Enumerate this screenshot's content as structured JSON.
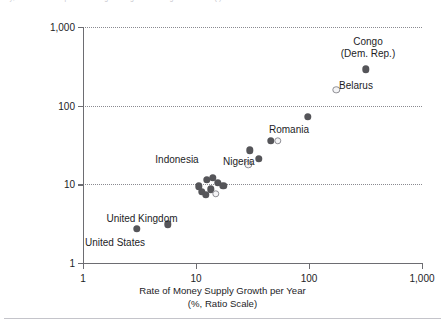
{
  "figure": {
    "top_clipped_caption": "sy, innate and deep into the engineering of the design such as ... ( )",
    "background": "#ffffff",
    "marker_color_solid": "#555559",
    "marker_color_open": "#8e8e94"
  },
  "chart_data": {
    "type": "scatter",
    "title": "",
    "xlabel": "Rate of Money Supply Growth per Year",
    "xlabel_sub": "(%, Ratio Scale)",
    "ylabel": "Rate of Inflation per Year (%, Ratio Scale)",
    "xscale": "log",
    "yscale": "log",
    "xlim": [
      1,
      1000
    ],
    "ylim": [
      1,
      1000
    ],
    "xticks": [
      "1",
      "10",
      "100",
      "1,000"
    ],
    "xtick_values": [
      1,
      10,
      100,
      1000
    ],
    "yticks": [
      "1",
      "10",
      "100",
      "1,000"
    ],
    "ytick_values": [
      1,
      10,
      100,
      1000
    ],
    "grid": "horizontal-dotted",
    "legend": "none",
    "annotations": [
      {
        "text": "Congo\n(Dem. Rep.)",
        "line1": "Congo",
        "line2": "(Dem. Rep.)",
        "anchor": "above"
      },
      {
        "text": "Belarus",
        "anchor": "right"
      },
      {
        "text": "Romania",
        "anchor": "right"
      },
      {
        "text": "Nigeria",
        "anchor": "below"
      },
      {
        "text": "Indonesia",
        "anchor": "above"
      },
      {
        "text": "United Kingdom",
        "anchor": "above"
      },
      {
        "text": "United States",
        "anchor": "below"
      }
    ],
    "points": [
      {
        "label": "Congo (Dem. Rep.)",
        "x": 320,
        "y": 290,
        "style": "solid"
      },
      {
        "label": "Belarus",
        "x": 175,
        "y": 160,
        "style": "open"
      },
      {
        "label": "",
        "x": 97,
        "y": 72,
        "style": "solid"
      },
      {
        "label": "Romania",
        "x": 46,
        "y": 36,
        "style": "solid"
      },
      {
        "label": "",
        "x": 53,
        "y": 36,
        "style": "open"
      },
      {
        "label": "",
        "x": 30,
        "y": 27,
        "style": "solid"
      },
      {
        "label": "",
        "x": 36,
        "y": 21,
        "style": "solid"
      },
      {
        "label": "Nigeria",
        "x": 29,
        "y": 18,
        "style": "open"
      },
      {
        "label": "",
        "x": 14,
        "y": 12,
        "style": "solid"
      },
      {
        "label": "Indonesia",
        "x": 12.5,
        "y": 11.5,
        "style": "solid"
      },
      {
        "label": "",
        "x": 15.5,
        "y": 10.5,
        "style": "solid"
      },
      {
        "label": "",
        "x": 17.5,
        "y": 9.6,
        "style": "solid"
      },
      {
        "label": "",
        "x": 13.5,
        "y": 8.6,
        "style": "solid"
      },
      {
        "label": "",
        "x": 11.3,
        "y": 8.0,
        "style": "solid"
      },
      {
        "label": "",
        "x": 12.2,
        "y": 7.4,
        "style": "solid"
      },
      {
        "label": "",
        "x": 15.0,
        "y": 7.6,
        "style": "open"
      },
      {
        "label": "",
        "x": 10.6,
        "y": 9.4,
        "style": "solid"
      },
      {
        "label": "United Kingdom",
        "x": 5.6,
        "y": 3.1,
        "style": "solid"
      },
      {
        "label": "United States",
        "x": 3.0,
        "y": 2.7,
        "style": "solid"
      }
    ]
  },
  "axis_titles": {
    "y": "Rate of Inflation per Year (%, Ratio Scale)",
    "x_line1": "Rate of Money Supply Growth per Year",
    "x_line2": "(%, Ratio Scale)"
  },
  "labels": {
    "congo_l1": "Congo",
    "congo_l2": "(Dem. Rep.)",
    "belarus": "Belarus",
    "romania": "Romania",
    "nigeria": "Nigeria",
    "indonesia": "Indonesia",
    "united_kingdom": "United Kingdom",
    "united_states": "United States"
  },
  "ticks": {
    "y": [
      "1,000",
      "100",
      "10",
      "1"
    ],
    "x": [
      "1",
      "10",
      "100",
      "1,000"
    ]
  }
}
